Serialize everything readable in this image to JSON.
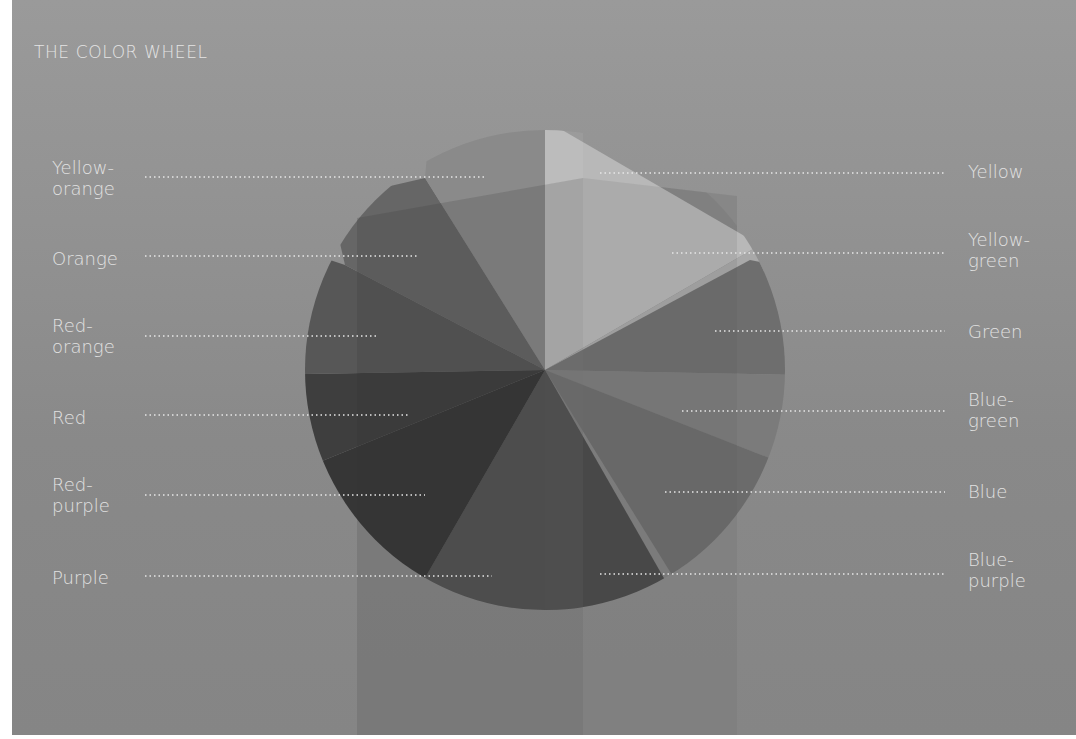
{
  "title": "THE COLOR WHEEL",
  "colors": {
    "background_top": "#9a9a9a",
    "background_bottom": "#858585",
    "label_text": "#e2e2e2",
    "leader_line": "#e6e6e6"
  },
  "wheel": {
    "center": [
      545,
      370
    ],
    "radius": 240,
    "segments": [
      {
        "name": "Yellow",
        "shade": "#b4b4b4"
      },
      {
        "name": "Yellow-green",
        "shade": "#a8a8a8"
      },
      {
        "name": "Green",
        "shade": "#707070"
      },
      {
        "name": "Blue-green",
        "shade": "#7a7a7a"
      },
      {
        "name": "Blue",
        "shade": "#6c6c6c"
      },
      {
        "name": "Blue-purple",
        "shade": "#4c4c4c"
      },
      {
        "name": "Purple",
        "shade": "#545454"
      },
      {
        "name": "Red-purple",
        "shade": "#3a3a3a"
      },
      {
        "name": "Red",
        "shade": "#404040"
      },
      {
        "name": "Red-orange",
        "shade": "#555555"
      },
      {
        "name": "Orange",
        "shade": "#686868"
      },
      {
        "name": "Yellow-orange",
        "shade": "#8e8e8e"
      }
    ]
  },
  "labels": {
    "left": [
      {
        "line1": "Yellow-",
        "line2": "orange"
      },
      {
        "line1": "Orange",
        "line2": ""
      },
      {
        "line1": "Red-",
        "line2": "orange"
      },
      {
        "line1": "Red",
        "line2": ""
      },
      {
        "line1": "Red-",
        "line2": "purple"
      },
      {
        "line1": "Purple",
        "line2": ""
      }
    ],
    "right": [
      {
        "line1": "Yellow",
        "line2": ""
      },
      {
        "line1": "Yellow-",
        "line2": "green"
      },
      {
        "line1": "Green",
        "line2": ""
      },
      {
        "line1": "Blue-",
        "line2": "green"
      },
      {
        "line1": "Blue",
        "line2": ""
      },
      {
        "line1": "Blue-",
        "line2": "purple"
      }
    ]
  }
}
